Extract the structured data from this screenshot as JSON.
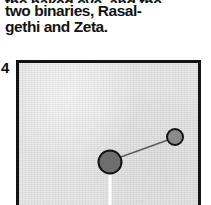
{
  "caption": {
    "lines": [
      "the naked eye, and the",
      "two binaries, Rasal-",
      "gethi and Zeta."
    ]
  },
  "figure": {
    "number": "4",
    "panel": {
      "background_color": "#e4e4e4",
      "border_color": "#131313",
      "border_width_px": 3,
      "width_px": 185,
      "height_px": 145
    },
    "elements": {
      "primary_star": {
        "label": "primary-star",
        "cx": 91,
        "cy": 99,
        "r": 11.5,
        "fill": "#6e6e6e",
        "stroke": "#131313",
        "stroke_width": 2
      },
      "secondary_star": {
        "label": "secondary-star",
        "cx": 156,
        "cy": 74,
        "r": 8,
        "fill": "#8a8a8a",
        "stroke": "#131313",
        "stroke_width": 2
      },
      "connector": {
        "label": "separation-line",
        "x1": 99,
        "y1": 95,
        "x2": 149,
        "y2": 77,
        "stroke": "#5e5e5e",
        "stroke_width": 1.6
      },
      "pointer": {
        "label": "white-pointer-line",
        "x1": 91,
        "y1": 110,
        "x2": 91,
        "y2": 142,
        "stroke": "#ffffff",
        "stroke_width": 3
      }
    }
  }
}
